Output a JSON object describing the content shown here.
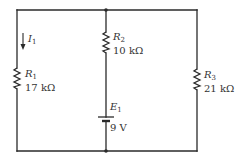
{
  "diagram": {
    "type": "circuit-schematic",
    "colors": {
      "line": "#2a2a2a",
      "text": "#333333",
      "background": "#ffffff"
    },
    "current": {
      "symbol": "I",
      "subscript": "1",
      "direction": "down"
    },
    "components": [
      {
        "id": "R1",
        "symbol": "R",
        "subscript": "1",
        "value": "17 kΩ",
        "branch": "left"
      },
      {
        "id": "R2",
        "symbol": "R",
        "subscript": "2",
        "value": "10 kΩ",
        "branch": "middle"
      },
      {
        "id": "E1",
        "symbol": "E",
        "subscript": "1",
        "value": "9 V",
        "branch": "middle",
        "kind": "battery"
      },
      {
        "id": "R3",
        "symbol": "R",
        "subscript": "3",
        "value": "21 kΩ",
        "branch": "right"
      }
    ]
  }
}
